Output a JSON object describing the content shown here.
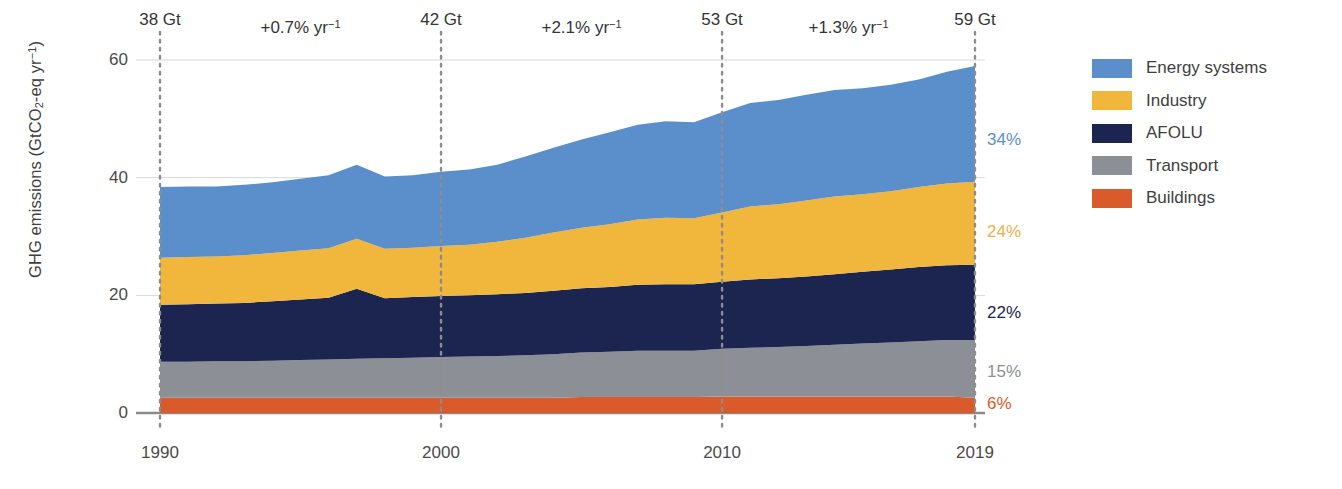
{
  "chart_data": {
    "type": "area",
    "stacked": true,
    "title": "",
    "xlabel": "",
    "ylabel": "GHG emissions (GtCO2-eq yr-1)",
    "ylabel_parts": {
      "pre": "GHG emissions (GtCO",
      "sub": "2",
      "mid": "-eq yr",
      "sup": "−1",
      "post": ")"
    },
    "xlim": [
      1990,
      2019
    ],
    "ylim": [
      0,
      63
    ],
    "yticks": [
      0,
      20,
      40,
      60
    ],
    "ytick_labels": [
      "0",
      "20",
      "40",
      "60"
    ],
    "xticks": [
      1990,
      2000,
      2010,
      2019
    ],
    "xtick_labels": [
      "1990",
      "2000",
      "2010",
      "2019"
    ],
    "grid": "horizontal",
    "legend_position": "right",
    "x": [
      1990,
      1991,
      1992,
      1993,
      1994,
      1995,
      1996,
      1997,
      1998,
      1999,
      2000,
      2001,
      2002,
      2003,
      2004,
      2005,
      2006,
      2007,
      2008,
      2009,
      2010,
      2011,
      2012,
      2013,
      2014,
      2015,
      2016,
      2017,
      2018,
      2019
    ],
    "series": [
      {
        "name": "Buildings",
        "color": "#D95B2B",
        "end_share_pct": "6%",
        "values": [
          2.6,
          2.6,
          2.6,
          2.6,
          2.6,
          2.6,
          2.6,
          2.6,
          2.6,
          2.6,
          2.6,
          2.6,
          2.6,
          2.6,
          2.6,
          2.7,
          2.7,
          2.7,
          2.7,
          2.7,
          2.8,
          2.8,
          2.8,
          2.8,
          2.8,
          2.8,
          2.8,
          2.8,
          2.8,
          2.6
        ]
      },
      {
        "name": "Transport",
        "color": "#8C9096",
        "end_share_pct": "15%",
        "values": [
          6.1,
          6.1,
          6.2,
          6.2,
          6.3,
          6.4,
          6.5,
          6.6,
          6.7,
          6.8,
          6.9,
          7.0,
          7.1,
          7.2,
          7.4,
          7.6,
          7.7,
          7.9,
          7.9,
          7.9,
          8.1,
          8.3,
          8.4,
          8.6,
          8.8,
          9.0,
          9.2,
          9.4,
          9.6,
          9.8
        ]
      },
      {
        "name": "AFOLU",
        "color": "#1B2550",
        "end_share_pct": "22%",
        "values": [
          9.7,
          9.8,
          9.8,
          9.9,
          10.1,
          10.3,
          10.5,
          11.9,
          10.2,
          10.3,
          10.4,
          10.4,
          10.5,
          10.6,
          10.8,
          10.9,
          11.0,
          11.2,
          11.3,
          11.3,
          11.4,
          11.6,
          11.7,
          11.8,
          12.0,
          12.2,
          12.4,
          12.6,
          12.7,
          12.8
        ]
      },
      {
        "name": "Industry",
        "color": "#F0B73C",
        "end_share_pct": "24%",
        "values": [
          8.0,
          8.0,
          8.0,
          8.1,
          8.2,
          8.3,
          8.4,
          8.5,
          8.4,
          8.4,
          8.5,
          8.6,
          8.9,
          9.4,
          9.9,
          10.3,
          10.7,
          11.1,
          11.3,
          11.2,
          11.8,
          12.4,
          12.6,
          12.9,
          13.2,
          13.2,
          13.3,
          13.6,
          13.9,
          14.1
        ]
      },
      {
        "name": "Energy systems",
        "color": "#5B8FCC",
        "end_share_pct": "34%",
        "values": [
          12.0,
          12.0,
          11.9,
          12.0,
          12.0,
          12.2,
          12.4,
          12.6,
          12.3,
          12.3,
          12.6,
          12.8,
          13.1,
          13.8,
          14.4,
          15.0,
          15.6,
          16.1,
          16.4,
          16.3,
          17.0,
          17.6,
          17.7,
          18.0,
          18.1,
          18.0,
          18.1,
          18.3,
          19.0,
          19.7
        ]
      }
    ],
    "annotations": {
      "milestones": [
        {
          "year": 1990,
          "label": "38 Gt",
          "value": 38.4
        },
        {
          "year": 2000,
          "label": "42 Gt",
          "value": 41.0
        },
        {
          "year": 2010,
          "label": "53 Gt",
          "value": 51.3
        },
        {
          "year": 2019,
          "label": "59 Gt",
          "value": 59.0
        }
      ],
      "growth_rates": [
        {
          "from": 1990,
          "to": 2000,
          "label": "+0.7% yr−1",
          "pre": "+0.7% yr",
          "sup": "−1"
        },
        {
          "from": 2000,
          "to": 2010,
          "label": "+2.1% yr−1",
          "pre": "+2.1% yr",
          "sup": "−1"
        },
        {
          "from": 2010,
          "to": 2019,
          "label": "+1.3% yr−1",
          "pre": "+1.3% yr",
          "sup": "−1"
        }
      ]
    }
  },
  "legend": {
    "items": [
      {
        "label": "Energy systems",
        "color": "#5B8FCC"
      },
      {
        "label": "Industry",
        "color": "#F0B73C"
      },
      {
        "label": "AFOLU",
        "color": "#1B2550"
      },
      {
        "label": "Transport",
        "color": "#8C9096"
      },
      {
        "label": "Buildings",
        "color": "#D95B2B"
      }
    ]
  },
  "axis": {
    "ytick_labels": [
      "60",
      "40",
      "20",
      "0"
    ],
    "xtick_labels": [
      "1990",
      "2000",
      "2010",
      "2019"
    ]
  },
  "share_labels": [
    {
      "text": "34%",
      "color": "#5B8FCC"
    },
    {
      "text": "24%",
      "color": "#E8B24A"
    },
    {
      "text": "22%",
      "color": "#1B2550"
    },
    {
      "text": "15%",
      "color": "#8C9096"
    },
    {
      "text": "6%",
      "color": "#D95B2B"
    }
  ]
}
